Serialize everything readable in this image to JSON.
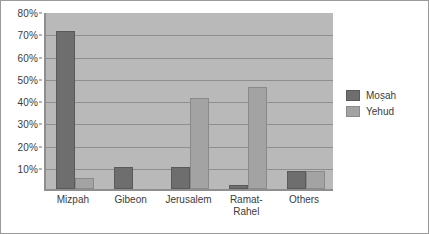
{
  "chart_data": {
    "type": "bar",
    "title": "",
    "subtitle": "",
    "xlabel": "",
    "ylabel": "",
    "categories": [
      "Mizpah",
      "Gibeon",
      "Jerusalem",
      "Ramat-\nRahel",
      "Others"
    ],
    "series": [
      {
        "name": "Moṣah",
        "color": "#6e6e6e",
        "values": [
          71,
          10,
          10,
          2,
          8
        ]
      },
      {
        "name": "Yehud",
        "color": "#a3a3a3",
        "values": [
          5,
          0,
          41,
          46,
          8
        ]
      }
    ],
    "ylim": [
      0,
      80
    ],
    "yticks": [
      10,
      20,
      30,
      40,
      50,
      60,
      70,
      80
    ],
    "ytick_labels": [
      "10%",
      "20%",
      "30%",
      "40%",
      "50%",
      "60%",
      "70%",
      "80%"
    ],
    "grid": true,
    "legend_position": "right",
    "plot_background": "#b9b9b9",
    "figure_background": "#ffffff",
    "axis_color": "#8e8e8e"
  }
}
